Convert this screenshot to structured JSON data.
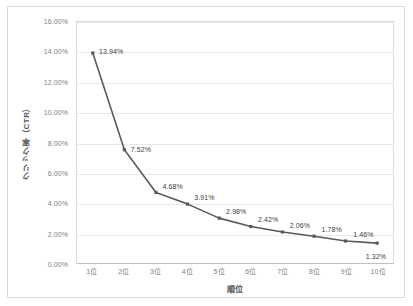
{
  "chart_data": {
    "type": "line",
    "title": "",
    "xlabel": "順位",
    "ylabel": "クリック率（CTR）",
    "categories": [
      "1位",
      "2位",
      "3位",
      "4位",
      "5位",
      "6位",
      "7位",
      "8位",
      "9位",
      "10位"
    ],
    "values": [
      13.94,
      7.52,
      4.68,
      3.91,
      2.98,
      2.42,
      2.06,
      1.78,
      1.46,
      1.32
    ],
    "point_labels": [
      "13.94%",
      "7.52%",
      "4.68%",
      "3.91%",
      "2.98%",
      "2.42%",
      "2.06%",
      "1.78%",
      "1.46%",
      "1.32%"
    ],
    "ylim": [
      0,
      16
    ],
    "ytick_values": [
      0,
      2,
      4,
      6,
      8,
      10,
      12,
      14,
      16
    ],
    "ytick_labels": [
      "0.00%",
      "2.00%",
      "4.00%",
      "6.00%",
      "8.00%",
      "10.00%",
      "12.00%",
      "14.00%",
      "16.00%"
    ],
    "grid": true,
    "legend": false,
    "series_color": "#595959",
    "marker_color": "#595959",
    "gridline_color": "#e8e8e8",
    "axis_color": "#d9d9d9",
    "tick_label_color": "#808080",
    "axis_title_color": "#595959",
    "data_label_color": "#404040",
    "background_color": "#ffffff",
    "marker": "square"
  }
}
